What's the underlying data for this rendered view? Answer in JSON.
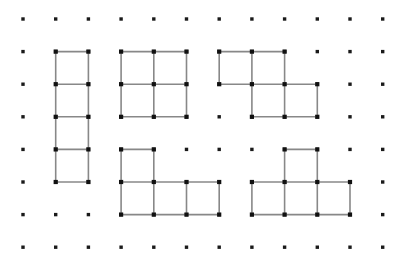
{
  "canvas": {
    "width": 413,
    "height": 271,
    "background": "#ffffff",
    "title": "Polyomino shapes on a dot grid"
  },
  "grid": {
    "columns": 12,
    "rows": 8,
    "origin_x": 23,
    "origin_y": 19,
    "spacing_x": 32.7,
    "spacing_y": 32.6,
    "dot_color": "#1a1a1a",
    "dot_size": 3.4,
    "dot_shape": "square"
  },
  "style": {
    "edge_color": "#888888",
    "edge_width": 1.6,
    "vertex_color": "#111111",
    "vertex_size": 4.2,
    "fill_color": "none"
  },
  "shapes": [
    {
      "name": "i-tetromino-vertical",
      "label": "I",
      "description": "vertical bar of four unit squares",
      "cells": [
        [
          1,
          1
        ],
        [
          1,
          2
        ],
        [
          1,
          3
        ],
        [
          1,
          4
        ]
      ]
    },
    {
      "name": "o-tetromino-square",
      "label": "O",
      "description": "two by two square of four unit squares",
      "cells": [
        [
          3,
          1
        ],
        [
          4,
          1
        ],
        [
          3,
          2
        ],
        [
          4,
          2
        ]
      ]
    },
    {
      "name": "s-tetromino",
      "label": "S",
      "description": "two cells on top row, two cells shifted right below",
      "cells": [
        [
          6,
          1
        ],
        [
          7,
          1
        ],
        [
          7,
          2
        ],
        [
          8,
          2
        ]
      ]
    },
    {
      "name": "j-tetromino",
      "label": "J",
      "description": "one cell above the leftmost of a row of three",
      "cells": [
        [
          3,
          4
        ],
        [
          3,
          5
        ],
        [
          4,
          5
        ],
        [
          5,
          5
        ]
      ]
    },
    {
      "name": "t-tetromino",
      "label": "T",
      "description": "one cell above the middle of a row of three",
      "cells": [
        [
          8,
          4
        ],
        [
          7,
          5
        ],
        [
          8,
          5
        ],
        [
          9,
          5
        ]
      ]
    }
  ]
}
